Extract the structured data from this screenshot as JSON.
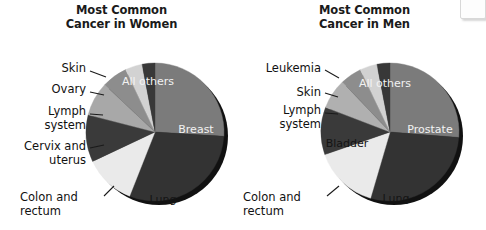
{
  "figure": {
    "background_color": "#ffffff",
    "corner_artifact": {
      "name": "corner-box"
    }
  },
  "palette": {
    "dark": "#2f2f2f",
    "medium_dark": "#3a3a3a",
    "medium": "#7b7b7b",
    "medium_light": "#9a9a9a",
    "light_gray": "#b3b3b3",
    "pale": "#cfcfcf",
    "near_white": "#eaeaea",
    "shadow": "#111111",
    "label_light": "#f2f2f2",
    "label_dark": "#141414"
  },
  "chart_data": [
    {
      "type": "pie",
      "id": "women",
      "title": "Most Common\nCancer in Women",
      "title_lines": [
        "Most Common",
        "Cancer in Women"
      ],
      "center": {
        "x": 155,
        "y": 132
      },
      "radius": 69,
      "start_angle_deg": -90,
      "categories": [
        "All others",
        "Breast",
        "Lung",
        "Colon and rectum",
        "Cervix and uterus",
        "Lymph system",
        "Ovary",
        "Skin"
      ],
      "values": [
        26,
        30,
        12,
        11,
        8,
        6,
        4,
        3
      ],
      "colors": [
        "#7b7b7b",
        "#333333",
        "#eaeaea",
        "#3a3a3a",
        "#a8a8a8",
        "#8d8d8d",
        "#d2d2d2",
        "#383838"
      ],
      "slices": [
        {
          "label": "All others",
          "value": 26,
          "color": "#7b7b7b",
          "label_mode": "inside",
          "label_color": "#f2f2f2"
        },
        {
          "label": "Breast",
          "value": 30,
          "color": "#333333",
          "label_mode": "inside",
          "label_color": "#f2f2f2"
        },
        {
          "label": "Lung",
          "value": 12,
          "color": "#eaeaea",
          "label_mode": "inside",
          "label_color": "#141414"
        },
        {
          "label": "Colon and\nrectum",
          "value": 11,
          "color": "#3a3a3a",
          "label_mode": "callout",
          "label_color": "#111111"
        },
        {
          "label": "Cervix and\nuterus",
          "value": 8,
          "color": "#a8a8a8",
          "label_mode": "callout",
          "label_color": "#111111"
        },
        {
          "label": "Lymph\nsystem",
          "value": 6,
          "color": "#8d8d8d",
          "label_mode": "callout",
          "label_color": "#111111"
        },
        {
          "label": "Ovary",
          "value": 4,
          "color": "#d2d2d2",
          "label_mode": "callout",
          "label_color": "#111111"
        },
        {
          "label": "Skin",
          "value": 3,
          "color": "#383838",
          "label_mode": "callout",
          "label_color": "#111111"
        }
      ],
      "inside_labels": [
        {
          "text": "All others",
          "x": 148,
          "y": 85,
          "color": "#f2f2f2"
        },
        {
          "text": "Breast",
          "x": 196,
          "y": 133,
          "color": "#f2f2f2"
        },
        {
          "text": "Lung",
          "x": 163,
          "y": 203,
          "color": "#141414"
        }
      ],
      "callouts": [
        {
          "name": "callout-skin",
          "text": "Skin",
          "x": 20,
          "y": 62,
          "width": 66,
          "align": "right",
          "leader": {
            "x1": 90,
            "y1": 71,
            "x2": 106,
            "y2": 77
          }
        },
        {
          "name": "callout-ovary",
          "text": "Ovary",
          "x": 10,
          "y": 83,
          "width": 76,
          "align": "right",
          "leader": {
            "x1": 90,
            "y1": 92,
            "x2": 104,
            "y2": 95
          }
        },
        {
          "name": "callout-lymph-system",
          "text": "Lymph\nsystem",
          "x": 2,
          "y": 105,
          "width": 84,
          "align": "right",
          "leader": {
            "x1": 90,
            "y1": 114,
            "x2": 103,
            "y2": 115
          }
        },
        {
          "name": "callout-cervix-and-uterus",
          "text": "Cervix and\nuterus",
          "x": 0,
          "y": 140,
          "width": 86,
          "align": "right",
          "leader": {
            "x1": 90,
            "y1": 148,
            "x2": 104,
            "y2": 145
          }
        },
        {
          "name": "callout-colon-and-rectum",
          "text": "Colon and\nrectum",
          "x": 20,
          "y": 191,
          "width": 80,
          "align": "left",
          "leader": {
            "x1": 104,
            "y1": 196,
            "x2": 114,
            "y2": 186
          }
        }
      ]
    },
    {
      "type": "pie",
      "id": "men",
      "title": "Most Common\nCancer in Men",
      "title_lines": [
        "Most Common",
        "Cancer in Men"
      ],
      "center": {
        "x": 147,
        "y": 132
      },
      "radius": 69,
      "start_angle_deg": -90,
      "categories": [
        "All others",
        "Prostate",
        "Lung",
        "Colon and rectum",
        "Bladder",
        "Lymph system",
        "Skin",
        "Leukemia"
      ],
      "values": [
        26,
        28,
        15,
        11,
        7,
        5,
        4,
        3
      ],
      "colors": [
        "#7b7b7b",
        "#333333",
        "#eaeaea",
        "#3a3a3a",
        "#b0b0b0",
        "#8d8d8d",
        "#d2d2d2",
        "#383838"
      ],
      "slices": [
        {
          "label": "All others",
          "value": 26,
          "color": "#7b7b7b",
          "label_mode": "inside",
          "label_color": "#f2f2f2"
        },
        {
          "label": "Prostate",
          "value": 28,
          "color": "#333333",
          "label_mode": "inside",
          "label_color": "#f2f2f2"
        },
        {
          "label": "Lung",
          "value": 15,
          "color": "#eaeaea",
          "label_mode": "inside",
          "label_color": "#141414"
        },
        {
          "label": "Colon and\nrectum",
          "value": 11,
          "color": "#3a3a3a",
          "label_mode": "callout",
          "label_color": "#111111"
        },
        {
          "label": "Bladder",
          "value": 7,
          "color": "#b0b0b0",
          "label_mode": "inside",
          "label_color": "#141414"
        },
        {
          "label": "Lymph\nsystem",
          "value": 5,
          "color": "#8d8d8d",
          "label_mode": "callout",
          "label_color": "#111111"
        },
        {
          "label": "Skin",
          "value": 4,
          "color": "#d2d2d2",
          "label_mode": "callout",
          "label_color": "#111111"
        },
        {
          "label": "Leukemia",
          "value": 3,
          "color": "#383838",
          "label_mode": "callout",
          "label_color": "#111111"
        }
      ],
      "inside_labels": [
        {
          "text": "All others",
          "x": 142,
          "y": 87,
          "color": "#f2f2f2"
        },
        {
          "text": "Prostate",
          "x": 187,
          "y": 133,
          "color": "#f2f2f2"
        },
        {
          "text": "Lung",
          "x": 153,
          "y": 202,
          "color": "#141414"
        },
        {
          "text": "Bladder",
          "x": 104,
          "y": 147,
          "color": "#141414"
        }
      ],
      "callouts": [
        {
          "name": "callout-leukemia",
          "text": "Leukemia",
          "x": 0,
          "y": 62,
          "width": 78,
          "align": "right",
          "leader": {
            "x1": 82,
            "y1": 70,
            "x2": 96,
            "y2": 78
          }
        },
        {
          "name": "callout-skin",
          "text": "Skin",
          "x": 8,
          "y": 86,
          "width": 70,
          "align": "right",
          "leader": {
            "x1": 82,
            "y1": 93,
            "x2": 95,
            "y2": 97
          }
        },
        {
          "name": "callout-lymph-system",
          "text": "Lymph\nsystem",
          "x": 0,
          "y": 104,
          "width": 78,
          "align": "right",
          "leader": {
            "x1": 82,
            "y1": 113,
            "x2": 95,
            "y2": 114
          }
        },
        {
          "name": "callout-colon-and-rectum",
          "text": "Colon and\nrectum",
          "x": 0,
          "y": 191,
          "width": 80,
          "align": "left",
          "leader": {
            "x1": 84,
            "y1": 196,
            "x2": 96,
            "y2": 186
          }
        }
      ]
    }
  ]
}
